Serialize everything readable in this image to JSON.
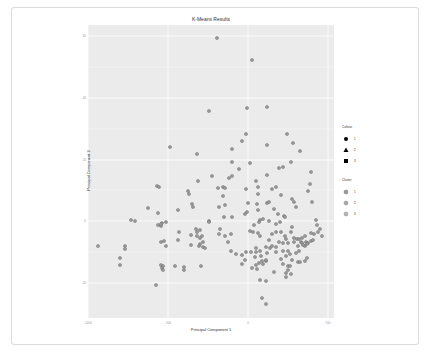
{
  "chart_data": {
    "type": "scatter",
    "title": "K-Means Results",
    "xlabel": "Principal Component 1",
    "ylabel": "Principal Component 2",
    "xlim": [
      -1000,
      550
    ],
    "ylim": [
      -33,
      62
    ],
    "x_ticks": [
      -1000,
      -500,
      0,
      500
    ],
    "y_ticks": [
      60,
      40,
      20,
      0,
      -20
    ],
    "grid": true,
    "legend_position": "right",
    "legends": [
      {
        "title": "Cultivar",
        "entries": [
          {
            "label": "1",
            "shape": "circle"
          },
          {
            "label": "2",
            "shape": "triangle"
          },
          {
            "label": "3",
            "shape": "square"
          }
        ]
      },
      {
        "title": "Cluster",
        "entries": [
          {
            "label": "1",
            "color": "#999999"
          },
          {
            "label": "2",
            "color": "#aaaaaa"
          },
          {
            "label": "3",
            "color": "#b3b3b3"
          }
        ]
      }
    ],
    "points_px": [
      [
        217,
        38
      ],
      [
        252,
        60
      ],
      [
        209,
        111
      ],
      [
        247,
        108
      ],
      [
        267,
        107
      ],
      [
        246,
        134
      ],
      [
        242,
        141
      ],
      [
        287,
        134
      ],
      [
        293,
        143
      ],
      [
        300,
        151
      ],
      [
        267,
        145
      ],
      [
        170,
        147
      ],
      [
        197,
        154
      ],
      [
        232,
        149
      ],
      [
        232,
        162
      ],
      [
        250,
        163
      ],
      [
        239,
        169
      ],
      [
        279,
        168
      ],
      [
        283,
        167
      ],
      [
        291,
        162
      ],
      [
        267,
        175
      ],
      [
        256,
        181
      ],
      [
        311,
        172
      ],
      [
        198,
        181
      ],
      [
        212,
        176
      ],
      [
        232,
        176
      ],
      [
        223,
        187
      ],
      [
        157,
        186
      ],
      [
        159,
        187
      ],
      [
        188,
        191
      ],
      [
        189,
        194
      ],
      [
        272,
        189
      ],
      [
        276,
        187
      ],
      [
        246,
        189
      ],
      [
        258,
        187
      ],
      [
        258,
        194
      ],
      [
        281,
        195
      ],
      [
        292,
        199
      ],
      [
        294,
        202
      ],
      [
        296,
        207
      ],
      [
        310,
        184
      ],
      [
        308,
        191
      ],
      [
        312,
        202
      ],
      [
        229,
        178
      ],
      [
        225,
        188
      ],
      [
        218,
        188
      ],
      [
        223,
        196
      ],
      [
        192,
        204
      ],
      [
        178,
        210
      ],
      [
        193,
        207
      ],
      [
        248,
        203
      ],
      [
        267,
        203
      ],
      [
        247,
        212
      ],
      [
        232,
        217
      ],
      [
        219,
        207
      ],
      [
        225,
        205
      ],
      [
        257,
        204
      ],
      [
        258,
        210
      ],
      [
        269,
        202
      ],
      [
        274,
        209
      ],
      [
        278,
        214
      ],
      [
        284,
        216
      ],
      [
        285,
        217
      ],
      [
        148,
        208
      ],
      [
        158,
        213
      ],
      [
        131,
        220
      ],
      [
        135,
        221
      ],
      [
        158,
        225
      ],
      [
        162,
        223
      ],
      [
        166,
        222
      ],
      [
        209,
        221
      ],
      [
        224,
        217
      ],
      [
        245,
        214
      ],
      [
        260,
        220
      ],
      [
        259,
        222
      ],
      [
        263,
        219
      ],
      [
        269,
        221
      ],
      [
        250,
        231
      ],
      [
        254,
        225
      ],
      [
        276,
        224
      ],
      [
        280,
        222
      ],
      [
        292,
        227
      ],
      [
        316,
        220
      ],
      [
        317,
        225
      ],
      [
        98,
        246
      ],
      [
        120,
        258
      ],
      [
        125,
        246
      ],
      [
        125,
        249
      ],
      [
        161,
        226
      ],
      [
        161,
        224
      ],
      [
        161,
        242
      ],
      [
        164,
        241
      ],
      [
        166,
        246
      ],
      [
        178,
        240
      ],
      [
        179,
        232
      ],
      [
        196,
        229
      ],
      [
        197,
        232
      ],
      [
        200,
        230
      ],
      [
        209,
        222
      ],
      [
        219,
        234
      ],
      [
        197,
        236
      ],
      [
        200,
        238
      ],
      [
        202,
        236
      ],
      [
        203,
        242
      ],
      [
        200,
        244
      ],
      [
        203,
        247
      ],
      [
        205,
        248
      ],
      [
        199,
        246
      ],
      [
        191,
        245
      ],
      [
        191,
        235
      ],
      [
        220,
        229
      ],
      [
        225,
        236
      ],
      [
        231,
        234
      ],
      [
        253,
        232
      ],
      [
        258,
        233
      ],
      [
        260,
        236
      ],
      [
        269,
        240
      ],
      [
        272,
        234
      ],
      [
        276,
        232
      ],
      [
        281,
        232
      ],
      [
        285,
        236
      ],
      [
        286,
        239
      ],
      [
        291,
        232
      ],
      [
        294,
        238
      ],
      [
        297,
        239
      ],
      [
        299,
        239
      ],
      [
        302,
        238
      ],
      [
        305,
        236
      ],
      [
        306,
        242
      ],
      [
        308,
        243
      ],
      [
        311,
        233
      ],
      [
        314,
        234
      ],
      [
        318,
        232
      ],
      [
        320,
        229
      ],
      [
        322,
        236
      ],
      [
        256,
        248
      ],
      [
        260,
        251
      ],
      [
        266,
        247
      ],
      [
        270,
        248
      ],
      [
        272,
        246
      ],
      [
        276,
        247
      ],
      [
        279,
        242
      ],
      [
        283,
        243
      ],
      [
        288,
        243
      ],
      [
        294,
        242
      ],
      [
        298,
        246
      ],
      [
        301,
        242
      ],
      [
        302,
        243
      ],
      [
        305,
        246
      ],
      [
        311,
        241
      ],
      [
        313,
        240
      ],
      [
        228,
        242
      ],
      [
        231,
        251
      ],
      [
        236,
        254
      ],
      [
        242,
        255
      ],
      [
        246,
        252
      ],
      [
        251,
        252
      ],
      [
        256,
        252
      ],
      [
        261,
        256
      ],
      [
        267,
        253
      ],
      [
        276,
        252
      ],
      [
        283,
        251
      ],
      [
        288,
        251
      ],
      [
        290,
        254
      ],
      [
        296,
        253
      ],
      [
        299,
        251
      ],
      [
        303,
        245
      ],
      [
        307,
        244
      ],
      [
        245,
        260
      ],
      [
        255,
        257
      ],
      [
        262,
        261
      ],
      [
        266,
        261
      ],
      [
        281,
        259
      ],
      [
        286,
        256
      ],
      [
        292,
        260
      ],
      [
        298,
        262
      ],
      [
        305,
        261
      ],
      [
        252,
        268
      ],
      [
        259,
        263
      ],
      [
        263,
        264
      ],
      [
        266,
        260
      ],
      [
        283,
        264
      ],
      [
        288,
        266
      ],
      [
        290,
        266
      ],
      [
        300,
        262
      ],
      [
        307,
        258
      ],
      [
        242,
        264
      ],
      [
        256,
        265
      ],
      [
        257,
        269
      ],
      [
        288,
        270
      ],
      [
        291,
        274
      ],
      [
        286,
        273
      ],
      [
        274,
        272
      ],
      [
        260,
        280
      ],
      [
        286,
        277
      ],
      [
        120,
        265
      ],
      [
        161,
        265
      ],
      [
        163,
        266
      ],
      [
        175,
        266
      ],
      [
        184,
        267
      ],
      [
        184,
        270
      ],
      [
        201,
        266
      ],
      [
        162,
        268
      ],
      [
        163,
        270
      ],
      [
        266,
        281
      ],
      [
        262,
        298
      ],
      [
        156,
        285
      ],
      [
        266,
        304
      ]
    ]
  },
  "header": {
    "title": "K-Means Results"
  },
  "axes": {
    "xlabel": "Principal Component 1",
    "ylabel": "Principal Component 2",
    "x_ticks": [
      "-1000",
      "-500",
      "0",
      "500"
    ],
    "y_ticks": [
      "60",
      "40",
      "20",
      "0",
      "-20"
    ]
  },
  "legend": {
    "cultivar_title": "Cultivar",
    "cultivar": [
      "1",
      "2",
      "3"
    ],
    "cluster_title": "Cluster",
    "cluster": [
      "1",
      "2",
      "3"
    ]
  },
  "colors": {
    "panel": "#ebebeb",
    "grid": "#ffffff",
    "point_fill": "#999999",
    "point_stroke": "#666666",
    "legend_marker": "#000000"
  }
}
